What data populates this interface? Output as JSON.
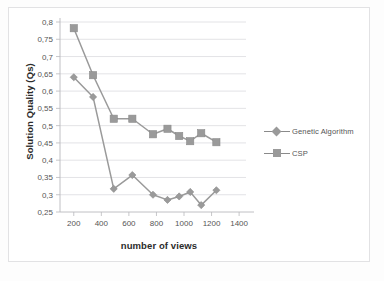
{
  "chart_data": {
    "type": "line",
    "title": "",
    "xlabel": "number of views",
    "ylabel": "Solution Quality (Qs)",
    "xlim": [
      100,
      1450
    ],
    "ylim": [
      0.25,
      0.8
    ],
    "grid": true,
    "legend_position": "right",
    "xticks": [
      "200",
      "400",
      "600",
      "800",
      "1000",
      "1200",
      "1400"
    ],
    "xtick_values": [
      200,
      400,
      600,
      800,
      1000,
      1200,
      1400
    ],
    "yticks": [
      "0,25",
      "0,3",
      "0,35",
      "0,4",
      "0,45",
      "0,5",
      "0,55",
      "0,6",
      "0,65",
      "0,7",
      "0,75",
      "0,8"
    ],
    "ytick_values": [
      0.25,
      0.3,
      0.35,
      0.4,
      0.45,
      0.5,
      0.55,
      0.6,
      0.65,
      0.7,
      0.75,
      0.8
    ],
    "x": [
      200,
      340,
      490,
      625,
      775,
      880,
      965,
      1045,
      1125,
      1235
    ],
    "series": [
      {
        "name": "Genetic Algorithm",
        "marker": "diamond",
        "color": "#9a9a9a",
        "values": [
          0.64,
          0.583,
          0.317,
          0.357,
          0.3,
          0.285,
          0.295,
          0.308,
          0.27,
          0.313
        ]
      },
      {
        "name": "CSP",
        "marker": "square",
        "color": "#9a9a9a",
        "values": [
          0.782,
          0.646,
          0.52,
          0.52,
          0.475,
          0.491,
          0.47,
          0.455,
          0.478,
          0.452
        ]
      }
    ]
  },
  "legend": {
    "items": [
      {
        "label": "Genetic Algorithm",
        "marker": "diamond"
      },
      {
        "label": "CSP",
        "marker": "square"
      }
    ]
  }
}
